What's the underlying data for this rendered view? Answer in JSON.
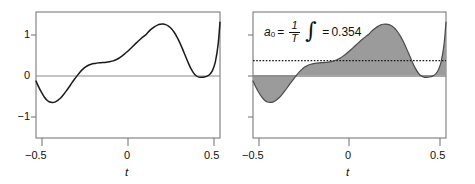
{
  "figure": {
    "width": 475,
    "height": 184,
    "background": "#ffffff",
    "panels": [
      {
        "id": "left",
        "name": "signal-plot",
        "frame": {
          "x": 36,
          "y": 12,
          "w": 184,
          "h": 126
        },
        "axis_label_x": "t",
        "x_ticks": [
          {
            "value": -0.5,
            "label": "−0.5"
          },
          {
            "value": 0,
            "label": "0"
          },
          {
            "value": 0.5,
            "label": "0.5"
          }
        ],
        "y_ticks": [
          {
            "value": 1,
            "label": "1"
          },
          {
            "value": 0,
            "label": "0"
          },
          {
            "value": -1,
            "label": "−1"
          }
        ],
        "zero_line": true,
        "fill": false
      },
      {
        "id": "right",
        "name": "integral-plot",
        "frame": {
          "x": 253,
          "y": 12,
          "w": 193,
          "h": 126
        },
        "axis_label_x": "t",
        "x_ticks": [
          {
            "value": -0.5,
            "label": "−0.5"
          },
          {
            "value": 0,
            "label": "0"
          },
          {
            "value": 0.5,
            "label": "0.5"
          }
        ],
        "y_ticks": [
          {
            "value": 1,
            "label": ""
          },
          {
            "value": 0,
            "label": ""
          },
          {
            "value": -1,
            "label": ""
          }
        ],
        "zero_line": true,
        "fill": true,
        "fill_color": "#9b9b9b",
        "mean_line": {
          "value": 0.354,
          "style": "dotted"
        },
        "annotation": {
          "symbol": "a",
          "subscript": "0",
          "equals": "=",
          "frac_num": "1",
          "frac_den": "T",
          "integral": "∫",
          "result_equals": "=",
          "result": "0.354",
          "full_text": "a0 = 1/T ∫ = 0.354"
        }
      }
    ],
    "line_color": "#1a1a1a",
    "axis_color": "#7d7d7d",
    "frame_color": "#6f6f6f"
  },
  "chart_data": {
    "type": "line",
    "title": "",
    "xlabel": "t",
    "ylabel": "",
    "xlim": [
      -0.5,
      0.5
    ],
    "ylim": [
      -1.55,
      1.55
    ],
    "grid": false,
    "legend": null,
    "annotations": [
      {
        "panel": "right",
        "text": "a_0 = (1/T) ∫ = 0.354",
        "value": 0.354
      }
    ],
    "series": [
      {
        "name": "f(t)",
        "panel": "both",
        "x": [
          -0.5,
          -0.485,
          -0.47,
          -0.455,
          -0.44,
          -0.425,
          -0.41,
          -0.395,
          -0.38,
          -0.365,
          -0.35,
          -0.335,
          -0.32,
          -0.305,
          -0.29,
          -0.275,
          -0.26,
          -0.245,
          -0.23,
          -0.215,
          -0.2,
          -0.185,
          -0.17,
          -0.155,
          -0.14,
          -0.125,
          -0.11,
          -0.095,
          -0.08,
          -0.065,
          -0.05,
          -0.035,
          -0.02,
          -0.005,
          0.01,
          0.025,
          0.04,
          0.055,
          0.07,
          0.085,
          0.1,
          0.115,
          0.13,
          0.145,
          0.16,
          0.175,
          0.19,
          0.205,
          0.22,
          0.235,
          0.25,
          0.265,
          0.28,
          0.295,
          0.31,
          0.325,
          0.34,
          0.355,
          0.37,
          0.385,
          0.4,
          0.415,
          0.43,
          0.445,
          0.46,
          0.475,
          0.49,
          0.5
        ],
        "y": [
          -0.15,
          -0.3,
          -0.43,
          -0.54,
          -0.62,
          -0.665,
          -0.675,
          -0.66,
          -0.62,
          -0.56,
          -0.48,
          -0.39,
          -0.295,
          -0.195,
          -0.1,
          -0.01,
          0.075,
          0.145,
          0.2,
          0.24,
          0.265,
          0.282,
          0.292,
          0.3,
          0.305,
          0.31,
          0.318,
          0.33,
          0.348,
          0.375,
          0.412,
          0.458,
          0.512,
          0.572,
          0.635,
          0.7,
          0.765,
          0.83,
          0.892,
          0.95,
          1.003,
          1.08,
          1.14,
          1.19,
          1.228,
          1.248,
          1.252,
          1.24,
          1.205,
          1.145,
          1.058,
          0.945,
          0.81,
          0.655,
          0.49,
          0.325,
          0.175,
          0.06,
          -0.018,
          -0.052,
          -0.058,
          -0.05,
          -0.028,
          0.02,
          0.12,
          0.33,
          0.76,
          1.3
        ]
      }
    ]
  }
}
